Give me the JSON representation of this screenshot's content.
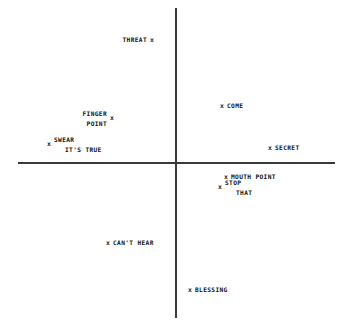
{
  "chart_data": {
    "type": "scatter",
    "title": "",
    "xlabel": "",
    "ylabel": "",
    "xlim": [
      -100,
      100
    ],
    "ylim": [
      -100,
      100
    ],
    "grid": false,
    "legend": null,
    "axes_style": "crossed-axes-at-origin",
    "marker_glyph": "x",
    "points": [
      {
        "label": "THREAT",
        "label_lines": [
          "THREAT"
        ],
        "label_position": "left",
        "x": -16,
        "y": 80,
        "px": 152,
        "py": 40
      },
      {
        "label": "COME",
        "label_lines": [
          "COME"
        ],
        "label_position": "right",
        "x": 28,
        "y": 40,
        "px": 222,
        "py": 106
      },
      {
        "label": "FINGER POINT",
        "label_lines": [
          "FINGER",
          "POINT"
        ],
        "label_position": "left",
        "x": -40,
        "y": 29,
        "px": 112,
        "py": 118
      },
      {
        "label": "SWEAR IT'S TRUE",
        "label_lines": [
          "SWEAR",
          "IT'S TRUE"
        ],
        "label_position": "right",
        "x": -78,
        "y": 9,
        "px": 49,
        "py": 144
      },
      {
        "label": "SECRET",
        "label_lines": [
          "SECRET"
        ],
        "label_position": "right",
        "x": 60,
        "y": 8,
        "px": 270,
        "py": 148
      },
      {
        "label": "MOUTH POINT",
        "label_lines": [
          "MOUTH POINT"
        ],
        "label_position": "right",
        "x": 30,
        "y": -9,
        "px": 226,
        "py": 177
      },
      {
        "label": "STOP THAT",
        "label_lines": [
          "STOP",
          "THAT"
        ],
        "label_position": "right",
        "x": 26,
        "y": -15,
        "px": 220,
        "py": 187
      },
      {
        "label": "CAN'T HEAR",
        "label_lines": [
          "CAN'T HEAR"
        ],
        "label_position": "right",
        "x": -42,
        "y": -49,
        "px": 108,
        "py": 243
      },
      {
        "label": "BLESSING",
        "label_lines": [
          "BLESSING"
        ],
        "label_position": "right",
        "x": 6,
        "y": -74,
        "px": 190,
        "py": 290
      }
    ]
  }
}
